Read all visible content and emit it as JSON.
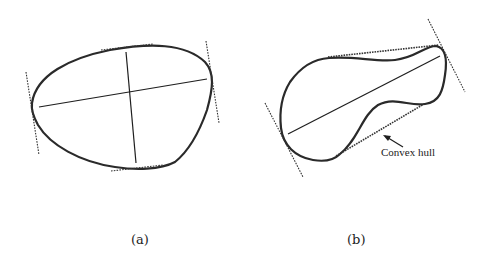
{
  "figure": {
    "panels": [
      {
        "id": "a",
        "caption": "(a)",
        "description": "Closed convex blob with major and minor axes and dotted tangent lines at four extreme points"
      },
      {
        "id": "b",
        "caption": "(b)",
        "description": "Non-convex elongated blob with its major axis, dotted tangent lines at two ends and dotted convex hull segments",
        "annotation": "Convex hull"
      }
    ],
    "colors": {
      "stroke": "#2a2a2a",
      "background": "#ffffff"
    }
  }
}
